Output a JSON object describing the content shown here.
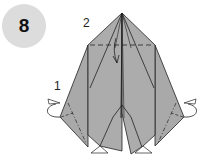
{
  "step": {
    "number": "8"
  },
  "labels": {
    "one": "1",
    "two": "2"
  },
  "colors": {
    "paper": "#a9a9a9",
    "paper_light": "#b8b8b8",
    "line": "#222222",
    "circle": "#dcdcdc"
  }
}
